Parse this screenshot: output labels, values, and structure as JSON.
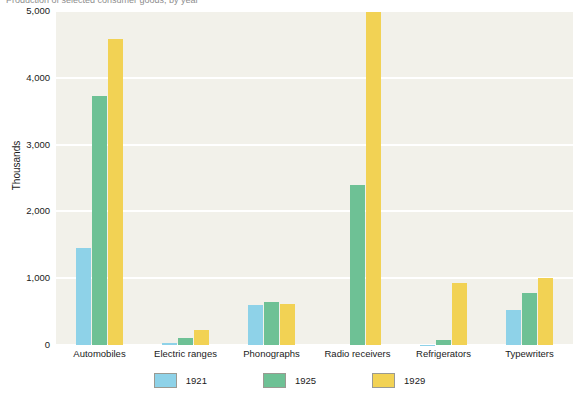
{
  "caption": {
    "text": "Production of selected consumer goods, by year"
  },
  "chart_data": {
    "type": "bar",
    "title": "",
    "xlabel": "",
    "ylabel": "Thousands",
    "ylim": [
      0,
      5000
    ],
    "yticks": [
      "0",
      "1,000",
      "2,000",
      "3,000",
      "4,000",
      "5,000"
    ],
    "ytick_values": [
      0,
      1000,
      2000,
      3000,
      4000,
      5000
    ],
    "grid": true,
    "legend_position": "bottom-center",
    "categories": [
      "Automobiles",
      "Electric ranges",
      "Phonographs",
      "Radio receivers",
      "Refrigerators",
      "Typewriters"
    ],
    "series": [
      {
        "name": "1921",
        "color": "#8ed2e8",
        "values": [
          1450,
          30,
          600,
          0,
          5,
          520
        ]
      },
      {
        "name": "1925",
        "color": "#6ec195",
        "values": [
          3730,
          100,
          645,
          2400,
          75,
          780
        ]
      },
      {
        "name": "1929",
        "color": "#f2d254",
        "values": [
          4580,
          230,
          610,
          4990,
          930,
          1010
        ]
      }
    ]
  },
  "plot_style": {
    "background": "#f2f1ea",
    "gridline_color": "#ffffff",
    "page_background": "#ffffff"
  }
}
